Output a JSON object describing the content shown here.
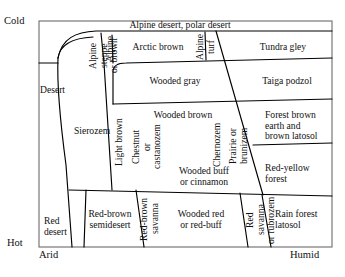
{
  "figure": {
    "type": "soil-climate-schematic-diagram",
    "axes": {
      "top_left_label": "Cold",
      "bottom_left_label": "Hot",
      "mid_left_label": "Desert",
      "bottom_left_axis_label": "Arid",
      "bottom_right_axis_label": "Humid",
      "vertical_axis_meaning": "Temperature (Cold at top, Hot at bottom)",
      "horizontal_axis_meaning": "Moisture (Arid at left, Humid at right)"
    },
    "zones": [
      {
        "id": "alpine-polar-desert",
        "label": "Alpine desert, polar desert",
        "orientation": "horizontal"
      },
      {
        "id": "alpine-steppe-or-brown",
        "label": "Alpine\nsteppe\nor brown",
        "orientation": "vertical"
      },
      {
        "id": "alpine",
        "label": "Alpine",
        "orientation": "vertical"
      },
      {
        "id": "arctic-brown",
        "label": "Arctic brown",
        "orientation": "horizontal"
      },
      {
        "id": "alpine-turf",
        "label": "Alpine\nturf",
        "orientation": "vertical"
      },
      {
        "id": "tundra-gley",
        "label": "Tundra gley",
        "orientation": "horizontal"
      },
      {
        "id": "wooded-gray",
        "label": "Wooded gray",
        "orientation": "horizontal"
      },
      {
        "id": "taiga-podzol",
        "label": "Taiga podzol",
        "orientation": "horizontal"
      },
      {
        "id": "sierozem",
        "label": "Sierozem",
        "orientation": "horizontal"
      },
      {
        "id": "light-brown",
        "label": "Light brown",
        "orientation": "vertical"
      },
      {
        "id": "chestnut-or-castanozem",
        "label": "Chestnut\nor\ncastanozem",
        "orientation": "vertical"
      },
      {
        "id": "wooded-brown",
        "label": "Wooded brown",
        "orientation": "horizontal"
      },
      {
        "id": "chernozem",
        "label": "Chernozem",
        "orientation": "vertical"
      },
      {
        "id": "prairie-or-brunizem",
        "label": "Prairie or\nbrunizem",
        "orientation": "vertical"
      },
      {
        "id": "forest-brown-earth-and-brown-latosol",
        "label": "Forest brown\nearth and\nbrown latosol",
        "orientation": "horizontal"
      },
      {
        "id": "wooded-buff-or-cinnamon",
        "label": "Wooded buff\nor cinnamon",
        "orientation": "horizontal"
      },
      {
        "id": "red-yellow-forest",
        "label": "Red-yellow\nforest",
        "orientation": "horizontal"
      },
      {
        "id": "red-desert",
        "label": "Red\ndesert",
        "orientation": "horizontal"
      },
      {
        "id": "red-brown-semidesert",
        "label": "Red-brown\nsemidesert",
        "orientation": "horizontal"
      },
      {
        "id": "red-brown-savanna",
        "label": "Red-brown\nsavanna",
        "orientation": "vertical"
      },
      {
        "id": "wooded-red-or-red-buff",
        "label": "Wooded red\nor red-buff",
        "orientation": "horizontal"
      },
      {
        "id": "red-savanna-or-rubrozem",
        "label": "Red savanna\nor rubrozem",
        "orientation": "vertical"
      },
      {
        "id": "rain-forest-latosol",
        "label": "Rain forest\nlatosol",
        "orientation": "horizontal"
      }
    ],
    "colors": {
      "line": "#000000",
      "frame": "#555555",
      "background": "#ffffff",
      "text": "#111111"
    }
  }
}
